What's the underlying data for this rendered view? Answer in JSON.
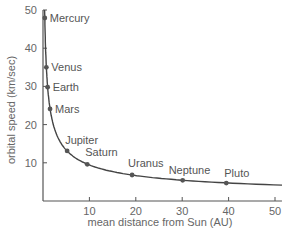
{
  "chart_data": {
    "type": "line",
    "title": "",
    "xlabel": "mean distance from Sun (AU)",
    "ylabel": "orbital speed (km/sec)",
    "xlim": [
      0,
      52
    ],
    "ylim": [
      0,
      50
    ],
    "xticks": [
      10,
      20,
      30,
      40,
      50
    ],
    "yticks": [
      10,
      20,
      30,
      40,
      50
    ],
    "grid": false,
    "legend": null,
    "series": [
      {
        "name": "Planets",
        "points": [
          {
            "label": "Mercury",
            "x": 0.39,
            "y": 47.9
          },
          {
            "label": "Venus",
            "x": 0.72,
            "y": 35.0
          },
          {
            "label": "Earth",
            "x": 1.0,
            "y": 29.8
          },
          {
            "label": "Mars",
            "x": 1.52,
            "y": 24.1
          },
          {
            "label": "Jupiter",
            "x": 5.2,
            "y": 13.1
          },
          {
            "label": "Saturn",
            "x": 9.54,
            "y": 9.6
          },
          {
            "label": "Uranus",
            "x": 19.2,
            "y": 6.8
          },
          {
            "label": "Neptune",
            "x": 30.1,
            "y": 5.4
          },
          {
            "label": "Pluto",
            "x": 39.5,
            "y": 4.7
          }
        ]
      }
    ],
    "curve_note": "Keplerian curve v ≈ 29.8/sqrt(d)"
  },
  "colors": {
    "axis": "#555555",
    "curve": "#444444",
    "marker": "#555555",
    "text": "#666666"
  }
}
